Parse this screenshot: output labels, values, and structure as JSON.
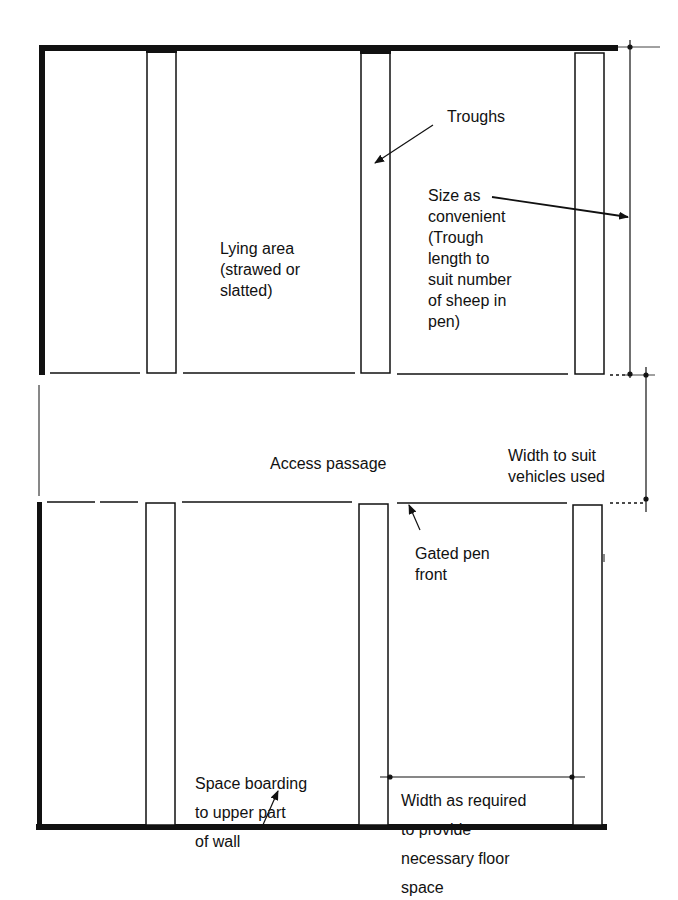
{
  "diagram": {
    "type": "floor-plan",
    "colors": {
      "line": "#111111",
      "background": "#ffffff"
    },
    "labels": {
      "troughs": "Troughs",
      "size_as_convenient": "Size as\nconvenient\n(Trough\nlength to\nsuit number\nof sheep in\npen)",
      "lying_area": "Lying area\n(strawed or\nslatted)",
      "access_passage": "Access passage",
      "width_to_suit": "Width to suit\nvehicles used",
      "gated_pen_front": "Gated pen\nfront",
      "space_boarding": "Space boarding\nto upper part\nof wall",
      "width_as_required": "Width as required\nto provide\nnecessary floor\nspace"
    }
  }
}
